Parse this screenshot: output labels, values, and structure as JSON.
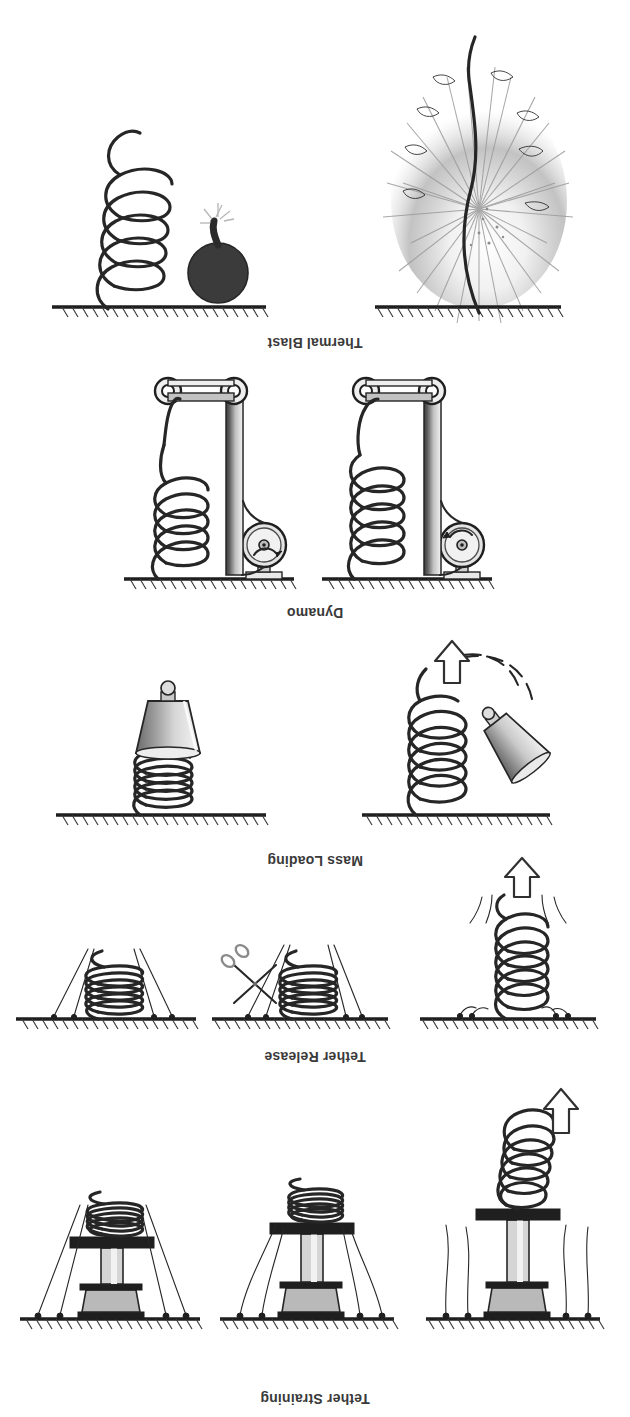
{
  "figure": {
    "title_hidden": "",
    "orientation": "rotated-180",
    "background_color": "#ffffff",
    "ink_color": "#262626",
    "width": 630,
    "height": 1417
  },
  "groups": [
    {
      "id": "tether-straining",
      "label": "Tether Straining",
      "label_y": 10,
      "panel_count": 3,
      "panels": [
        {
          "id": "ts-1",
          "state": "spring relaxed / piston extended",
          "has_tethers": true,
          "has_arrow": true,
          "coil_turns": 6
        },
        {
          "id": "ts-2",
          "state": "spring partly compressed",
          "has_tethers": true,
          "has_arrow": false,
          "coil_turns": 6
        },
        {
          "id": "ts-3",
          "state": "spring fully compressed / tethers taut",
          "has_tethers": true,
          "has_arrow": false,
          "coil_turns": 6
        }
      ]
    },
    {
      "id": "tether-release",
      "label": "Tether Release",
      "label_y": 352,
      "panel_count": 3,
      "panels": [
        {
          "id": "tr-1",
          "state": "released, spring extended",
          "has_tethers": true,
          "has_arrow": true,
          "coil_turns": 6
        },
        {
          "id": "tr-2",
          "state": "tether being cut by scissors",
          "has_tethers": true,
          "has_scissors": true,
          "coil_turns": 6
        },
        {
          "id": "tr-3",
          "state": "held compressed by tethers",
          "has_tethers": true,
          "coil_turns": 6
        }
      ]
    },
    {
      "id": "mass-loading",
      "label": "Mass Loading",
      "label_y": 548,
      "panel_count": 2,
      "panels": [
        {
          "id": "ml-1",
          "state": "mass approaching, spring extended",
          "has_mass": true,
          "has_arrow": true,
          "has_swing_path": true,
          "coil_turns": 5
        },
        {
          "id": "ml-2",
          "state": "mass attached, spring compressed",
          "has_mass": true,
          "coil_turns": 5
        }
      ]
    },
    {
      "id": "dynamo",
      "label": "Dynamo",
      "label_y": 798,
      "panel_count": 2,
      "panels": [
        {
          "id": "dy-1",
          "state": "belt driven, spring extended",
          "has_wheel": true,
          "has_belt": true,
          "coil_turns": 5
        },
        {
          "id": "dy-2",
          "state": "belt driven, spring compressed",
          "has_wheel": true,
          "has_belt": true,
          "coil_turns": 5
        }
      ]
    },
    {
      "id": "thermal-blast",
      "label": "Thermal Blast",
      "label_y": 1068,
      "panel_count": 2,
      "panels": [
        {
          "id": "tb-1",
          "state": "detonation / blast plume, tether vaporised",
          "has_blast": true
        },
        {
          "id": "tb-2",
          "state": "charge attached beside compressed spring",
          "has_bomb": true,
          "coil_turns": 5
        }
      ]
    }
  ],
  "legend": {
    "arrow_meaning": "direction of spring travel",
    "hatched_line_meaning": "fixed ceiling / rigid support"
  }
}
